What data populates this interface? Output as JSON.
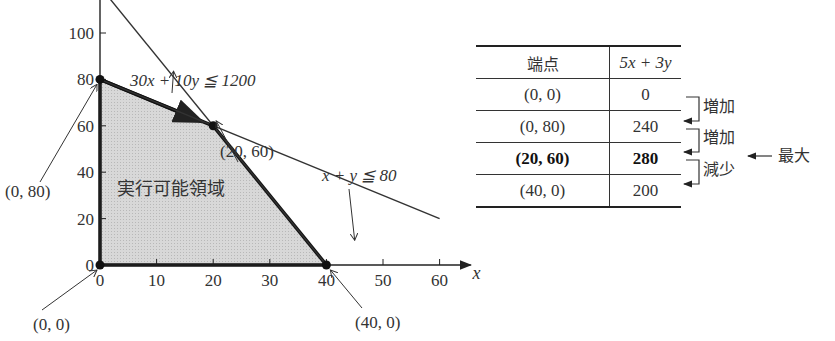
{
  "chart_data": {
    "type": "line",
    "title": "",
    "xlabel": "x",
    "ylabel": "y",
    "xlim": [
      0,
      65
    ],
    "ylim": [
      0,
      150
    ],
    "x_ticks": [
      0,
      10,
      20,
      30,
      40,
      50,
      60
    ],
    "y_ticks": [
      0,
      20,
      40,
      60,
      80,
      100,
      120,
      140
    ],
    "x_tick_labels": [
      "0",
      "10",
      "20",
      "30",
      "40",
      "50",
      "60"
    ],
    "y_tick_labels": [
      "0",
      "20",
      "40",
      "60",
      "80",
      "100",
      "120",
      "140"
    ],
    "grid": false,
    "series": [
      {
        "name": "line-a",
        "points": [
          [
            0,
            120
          ],
          [
            40,
            0
          ]
        ]
      },
      {
        "name": "line-b",
        "points": [
          [
            0,
            80
          ],
          [
            60,
            20
          ]
        ]
      }
    ],
    "feasible_region": {
      "label": "実行可能領域",
      "vertices": [
        [
          0,
          0
        ],
        [
          0,
          80
        ],
        [
          20,
          60
        ],
        [
          40,
          0
        ]
      ]
    },
    "vertex_labels": [
      {
        "text": "(0, 0)",
        "point": [
          0,
          0
        ]
      },
      {
        "text": "(0, 80)",
        "point": [
          0,
          80
        ]
      },
      {
        "text": "(20, 60)",
        "point": [
          20,
          60
        ]
      },
      {
        "text": "(40, 0)",
        "point": [
          40,
          0
        ]
      }
    ],
    "annotations": [
      {
        "text": "30x + 10y ≦ 1200",
        "points_to": [
          13,
          90
        ]
      },
      {
        "text": "x + y ≦ 80",
        "points_to": [
          45,
          15
        ]
      }
    ]
  },
  "table": {
    "headers": [
      "端点",
      "5x + 3y"
    ],
    "rows": [
      {
        "point": "(0, 0)",
        "value": "0",
        "bold": false
      },
      {
        "point": "(0, 80)",
        "value": "240",
        "bold": false
      },
      {
        "point": "(20, 60)",
        "value": "280",
        "bold": true
      },
      {
        "point": "(40, 0)",
        "value": "200",
        "bold": false
      }
    ],
    "changes": [
      "増加",
      "増加",
      "減少"
    ],
    "max_label": "最大"
  }
}
